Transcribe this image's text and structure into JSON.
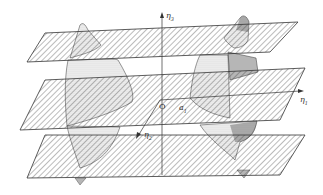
{
  "figure": {
    "axes": {
      "eta1": {
        "label": "η",
        "sub": "1",
        "direction": "right"
      },
      "eta2": {
        "label": "η",
        "sub": "2",
        "direction": "front-left"
      },
      "eta3": {
        "label": "η",
        "sub": "3",
        "direction": "up"
      }
    },
    "points": {
      "origin": {
        "label": "O"
      },
      "a1": {
        "label": "a",
        "sub": "1"
      }
    },
    "planes": [
      {
        "name": "upper-plane"
      },
      {
        "name": "middle-plane"
      },
      {
        "name": "lower-plane"
      }
    ],
    "surfaces": [
      {
        "name": "left-surface"
      },
      {
        "name": "right-surface"
      }
    ],
    "colors": {
      "line": "#333333",
      "hatch": "#555555",
      "stipple": "#444444",
      "background": "#ffffff"
    }
  }
}
